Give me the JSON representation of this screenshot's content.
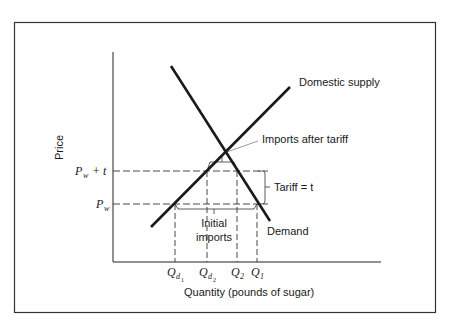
{
  "diagram": {
    "y_axis_label": "Price",
    "x_axis_label": "Quantity (pounds of sugar)",
    "curves": {
      "supply_label": "Domestic supply",
      "demand_label": "Demand"
    },
    "price_levels": {
      "pw_plus_t": {
        "main": "P",
        "sub": "w",
        "suffix": "+ t"
      },
      "pw": {
        "main": "P",
        "sub": "w"
      }
    },
    "quantity_ticks": [
      {
        "main": "Q",
        "sub": "d",
        "subsub": "1"
      },
      {
        "main": "Q",
        "sub": "d",
        "subsub": "2"
      },
      {
        "main": "Q",
        "sub": "2"
      },
      {
        "main": "Q",
        "sub": "1"
      }
    ],
    "annotations": {
      "imports_after_tariff": "Imports after tariff",
      "tariff": "Tariff = t",
      "initial_imports_line1": "Initial",
      "initial_imports_line2": "imports"
    },
    "colors": {
      "line": "#1a1a1a",
      "frame": "#333333",
      "background": "#ffffff"
    }
  }
}
